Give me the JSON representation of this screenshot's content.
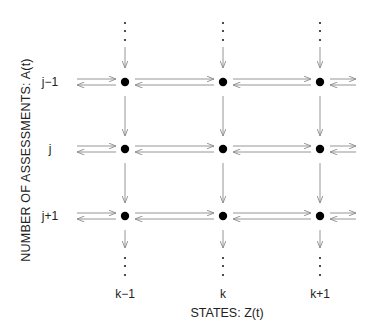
{
  "axes": {
    "x_label": "STATES: Z(t)",
    "y_label": "NUMBER  OF  ASSESSMENTS: A(t)"
  },
  "columns": [
    {
      "label": "k−1",
      "x": 125
    },
    {
      "label": "k",
      "x": 223
    },
    {
      "label": "k+1",
      "x": 320
    }
  ],
  "rows": [
    {
      "label": "j−1",
      "y": 82
    },
    {
      "label": "j",
      "y": 149
    },
    {
      "label": "j+1",
      "y": 216
    }
  ],
  "style": {
    "node_color": "#000000",
    "arrow_color": "#8a8a8a",
    "text_color": "#222222"
  },
  "continuation": {
    "top": "⋮",
    "bottom": "⋮"
  }
}
